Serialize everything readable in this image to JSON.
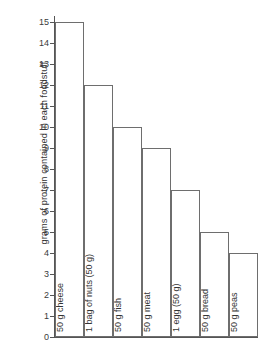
{
  "chart_data": {
    "type": "bar",
    "title": "",
    "subtitle": "",
    "xlabel": "",
    "ylabel": "grams of protein contained in each foodstuff",
    "ylim": [
      0,
      15
    ],
    "ytick_step": 1,
    "yticks": [
      "15",
      "14",
      "13",
      "12",
      "11",
      "10",
      "9",
      "8",
      "7",
      "6",
      "5",
      "4",
      "3",
      "2",
      "1",
      "0"
    ],
    "grid": false,
    "legend": false,
    "bar_style": "adjacent-outline",
    "categories": [
      "50 g cheese",
      "1 bag of nuts (50 g)",
      "50 g fish",
      "50 g meat",
      "1 egg (50 g)",
      "50 g bread",
      "50 g peas"
    ],
    "values": [
      15,
      12,
      10,
      9,
      7,
      5,
      4
    ],
    "bars": [
      {
        "label": "50 g cheese",
        "value": 15
      },
      {
        "label": "1 bag of nuts (50 g)",
        "value": 12
      },
      {
        "label": "50 g fish",
        "value": 10
      },
      {
        "label": "50 g meat",
        "value": 9
      },
      {
        "label": "1 egg (50 g)",
        "value": 7
      },
      {
        "label": "50 g bread",
        "value": 5
      },
      {
        "label": "50 g peas",
        "value": 4
      }
    ],
    "colors": {
      "bar_fill": "#ffffff",
      "bar_stroke": "#6e6e6e",
      "axis": "#555555",
      "text": "#333333",
      "background": "#ffffff"
    }
  }
}
